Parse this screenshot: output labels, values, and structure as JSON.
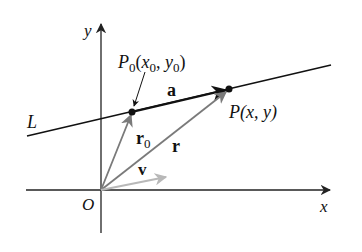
{
  "diagram": {
    "type": "vector-line-diagram",
    "colors": {
      "background": "#ffffff",
      "axis": "#222222",
      "line": "#111111",
      "position_vectors": "#7a7a7a",
      "direction_vector": "#b8b8b8",
      "labels": "#111111"
    },
    "axes": {
      "x_label": "x",
      "y_label": "y",
      "origin_label": "O"
    },
    "line": {
      "label": "L"
    },
    "points": {
      "p0": {
        "name": "P",
        "sub": "0",
        "open": "(",
        "x": "x",
        "xsub": "0",
        "comma": ", ",
        "y": "y",
        "ysub": "0",
        "close": ")"
      },
      "p": {
        "name": "P",
        "coords": "(x, y)"
      }
    },
    "vectors": {
      "a": "a",
      "r0": {
        "name": "r",
        "sub": "0"
      },
      "r": "r",
      "v": "v"
    }
  }
}
